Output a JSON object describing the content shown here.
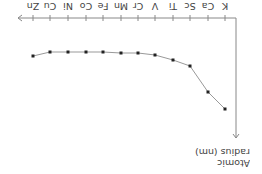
{
  "chart_data": {
    "type": "line",
    "title": "",
    "orientation_note": "figure rendered rotated 180 degrees",
    "xlabel": "",
    "ylabel": "Atomic radius (nm)",
    "ylabel_lines": [
      "Atomic",
      "radius (nm)"
    ],
    "categories": [
      "K",
      "Ca",
      "Sc",
      "Ti",
      "V",
      "Cr",
      "Mn",
      "Fe",
      "Co",
      "Ni",
      "Cu",
      "Zn"
    ],
    "series": [
      {
        "name": "Atomic radius",
        "values": [
          0.227,
          0.197,
          0.162,
          0.147,
          0.134,
          0.128,
          0.127,
          0.126,
          0.125,
          0.124,
          0.128,
          0.134
        ]
      }
    ],
    "axis_ticks_y": "none",
    "grid": false,
    "legend": "none",
    "marker": "square",
    "colors": {
      "line": "#999999",
      "marker": "#222222",
      "axis": "#888888",
      "text": "#444444"
    }
  },
  "screen_points": {
    "x": [
      225,
      208,
      190,
      173,
      155,
      138,
      121,
      103,
      86,
      68,
      50,
      33
    ],
    "y": [
      109,
      92,
      66,
      60,
      55,
      53,
      53,
      52,
      52,
      52,
      52,
      56
    ]
  }
}
